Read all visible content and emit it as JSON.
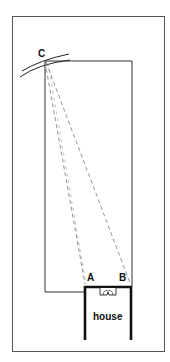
{
  "diagram": {
    "labels": {
      "point_c": "C",
      "point_a": "A",
      "point_b": "B",
      "house": "house"
    },
    "colors": {
      "line": "#333333",
      "thick_line": "#111111",
      "dashed_line": "#777777",
      "background": "#ffffff"
    }
  }
}
